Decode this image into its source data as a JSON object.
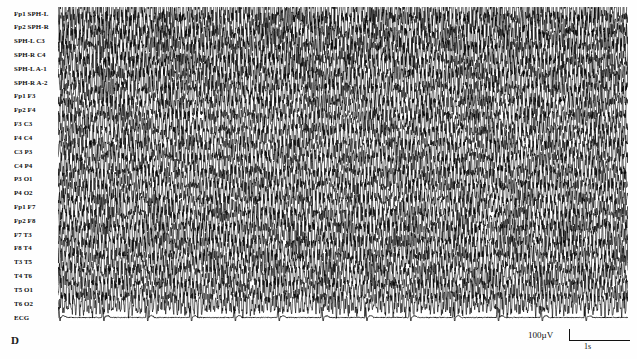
{
  "figure": {
    "panel_label": "D",
    "type": "eeg-recording"
  },
  "channels": [
    "Fp1 SPH-L",
    "Fp2 SPH-R",
    "SPH-L C3",
    "SPH-R C4",
    "SPH-L A-1",
    "SPH-R A-2",
    "Fp1 F3",
    "Fp2 F4",
    "F3 C3",
    "F4 C4",
    "C3 P3",
    "C4 P4",
    "P3 O1",
    "P4 O2",
    "Fp1 F7",
    "Fp2 F8",
    "F7 T3",
    "F8 T4",
    "T3 T5",
    "T4 T6",
    "T5 O1",
    "T6 O2",
    "ECG"
  ],
  "calibration": {
    "amplitude_label": "100µV",
    "time_label": "1s"
  },
  "chart_data": {
    "type": "line",
    "title": "",
    "subtitle": "",
    "xlabel": "",
    "ylabel": "",
    "panel": "D",
    "recording_modality": "EEG polygraphic montage",
    "n_channels": 23,
    "channel_names": [
      "Fp1 SPH-L",
      "Fp2 SPH-R",
      "SPH-L C3",
      "SPH-R C4",
      "SPH-L A-1",
      "SPH-R A-2",
      "Fp1 F3",
      "Fp2 F4",
      "F3 C3",
      "F4 C4",
      "C3 P3",
      "C4 P4",
      "P3 O1",
      "P4 O2",
      "Fp1 F7",
      "Fp2 F8",
      "F7 T3",
      "F8 T4",
      "T3 T5",
      "T4 T6",
      "T5 O1",
      "T6 O2",
      "ECG"
    ],
    "scale_bars": {
      "amplitude": "100µV",
      "time": "1s"
    },
    "amplitude_uv_per_bar": 100,
    "time_s_per_bar": 1,
    "x_axis": {
      "units": "seconds",
      "visible_range_s": [
        0,
        10
      ],
      "ticks_shown": false
    },
    "y_axis": {
      "units": "microvolts",
      "ticks_shown": false
    },
    "grid": false,
    "legend": "none",
    "trace_color": "#000000",
    "background_color": "#ffffff",
    "annotations": [
      {
        "text": "100µV",
        "role": "amplitude-calibration",
        "position": "bottom-right"
      },
      {
        "text": "1s",
        "role": "time-calibration",
        "position": "bottom-right"
      },
      {
        "text": "D",
        "role": "panel-identifier",
        "position": "bottom-left"
      }
    ],
    "signal_description": "Continuous high-amplitude, high-frequency rhythmic spike-and-wave discharges across all channels, saturating the display",
    "series": [
      {
        "name": "Fp1 SPH-L",
        "amplitude_uv": 310,
        "dominant_freq_hz": 14.5,
        "seed": 101
      },
      {
        "name": "Fp2 SPH-R",
        "amplitude_uv": 300,
        "dominant_freq_hz": 14.0,
        "seed": 112
      },
      {
        "name": "SPH-L C3",
        "amplitude_uv": 290,
        "dominant_freq_hz": 15.0,
        "seed": 123
      },
      {
        "name": "SPH-R C4",
        "amplitude_uv": 295,
        "dominant_freq_hz": 14.2,
        "seed": 134
      },
      {
        "name": "SPH-L A-1",
        "amplitude_uv": 285,
        "dominant_freq_hz": 13.8,
        "seed": 145
      },
      {
        "name": "SPH-R A-2",
        "amplitude_uv": 288,
        "dominant_freq_hz": 14.6,
        "seed": 156
      },
      {
        "name": "Fp1 F3",
        "amplitude_uv": 265,
        "dominant_freq_hz": 13.2,
        "seed": 167
      },
      {
        "name": "Fp2 F4",
        "amplitude_uv": 262,
        "dominant_freq_hz": 13.6,
        "seed": 178
      },
      {
        "name": "F3 C3",
        "amplitude_uv": 258,
        "dominant_freq_hz": 14.1,
        "seed": 189
      },
      {
        "name": "F4 C4",
        "amplitude_uv": 260,
        "dominant_freq_hz": 13.4,
        "seed": 190
      },
      {
        "name": "C3 P3",
        "amplitude_uv": 252,
        "dominant_freq_hz": 14.8,
        "seed": 201
      },
      {
        "name": "C4 P4",
        "amplitude_uv": 255,
        "dominant_freq_hz": 13.9,
        "seed": 212
      },
      {
        "name": "P3 O1",
        "amplitude_uv": 248,
        "dominant_freq_hz": 15.2,
        "seed": 223
      },
      {
        "name": "P4 O2",
        "amplitude_uv": 250,
        "dominant_freq_hz": 14.3,
        "seed": 234
      },
      {
        "name": "Fp1 F7",
        "amplitude_uv": 268,
        "dominant_freq_hz": 13.1,
        "seed": 245
      },
      {
        "name": "Fp2 F8",
        "amplitude_uv": 266,
        "dominant_freq_hz": 13.7,
        "seed": 256
      },
      {
        "name": "F7 T3",
        "amplitude_uv": 272,
        "dominant_freq_hz": 14.4,
        "seed": 267
      },
      {
        "name": "F8 T4",
        "amplitude_uv": 270,
        "dominant_freq_hz": 14.9,
        "seed": 278
      },
      {
        "name": "T3 T5",
        "amplitude_uv": 256,
        "dominant_freq_hz": 13.5,
        "seed": 289
      },
      {
        "name": "T4 T6",
        "amplitude_uv": 254,
        "dominant_freq_hz": 14.7,
        "seed": 290
      },
      {
        "name": "T5 O1",
        "amplitude_uv": 244,
        "dominant_freq_hz": 15.4,
        "seed": 301
      },
      {
        "name": "T6 O2",
        "amplitude_uv": 246,
        "dominant_freq_hz": 14.0,
        "seed": 312
      },
      {
        "name": "ECG",
        "amplitude_uv": 180,
        "dominant_freq_hz": 1.3,
        "seed": 323
      }
    ]
  }
}
